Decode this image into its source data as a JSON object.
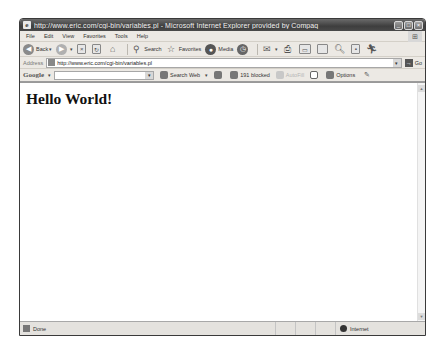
{
  "window": {
    "title": "http://www.eric.com/cgi-bin/variables.pl - Microsoft Internet Explorer provided by Compaq",
    "controls": {
      "minimize": "_",
      "maximize": "□",
      "close": "×"
    }
  },
  "menubar": {
    "items": [
      "File",
      "Edit",
      "View",
      "Favorites",
      "Tools",
      "Help"
    ]
  },
  "toolbar": {
    "back_label": "Back",
    "search_label": "Search",
    "favorites_label": "Favorites",
    "media_label": "Media"
  },
  "addressbar": {
    "label": "Address",
    "url": "http://www.eric.com/cgi-bin/variables.pl",
    "go_label": "Go"
  },
  "googlebar": {
    "logo": "Google",
    "search_value": "",
    "search_web_label": "Search Web",
    "blocked_label": "191 blocked",
    "autofill_label": "AutoFill",
    "options_label": "Options"
  },
  "content": {
    "heading": "Hello World!"
  },
  "statusbar": {
    "status_text": "Done",
    "zone_text": "Internet"
  }
}
